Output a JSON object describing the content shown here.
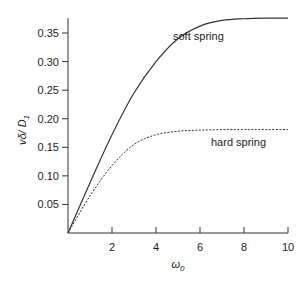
{
  "chart_data": {
    "type": "line",
    "title": "",
    "xlabel": "ω0",
    "ylabel": "vδ/D1",
    "xlim": [
      0,
      10
    ],
    "ylim": [
      0,
      0.35
    ],
    "x_ticks": [
      2,
      4,
      6,
      8,
      10
    ],
    "x_tick_labels": [
      "2",
      "4",
      "6",
      "8",
      "10"
    ],
    "y_ticks": [
      0.05,
      0.1,
      0.15,
      0.2,
      0.25,
      0.3,
      0.35
    ],
    "y_tick_labels": [
      "0.05",
      "0.10",
      "0.15",
      "0.20",
      "0.25",
      "0.30",
      "0.35"
    ],
    "grid": false,
    "legend": "none (inline annotations)",
    "x": [
      0,
      1,
      2,
      3,
      4,
      5,
      6,
      7,
      8,
      9,
      10
    ],
    "series": [
      {
        "name": "soft spring",
        "style": "solid",
        "values": [
          0,
          0.088,
          0.172,
          0.245,
          0.3,
          0.34,
          0.362,
          0.372,
          0.375,
          0.376,
          0.376
        ]
      },
      {
        "name": "hard spring",
        "style": "dotted",
        "values": [
          0,
          0.065,
          0.118,
          0.155,
          0.172,
          0.178,
          0.18,
          0.181,
          0.181,
          0.181,
          0.181
        ]
      }
    ],
    "annotations": [
      {
        "text": "soft spring",
        "x": 5.2,
        "y": 0.33
      },
      {
        "text": "hard spring",
        "x": 6.0,
        "y": 0.16
      }
    ]
  },
  "labels": {
    "xlabel_main": "ω",
    "xlabel_sub": "0",
    "ylabel_main": "vδ/ D",
    "ylabel_sub": "1",
    "soft": "soft spring",
    "hard": "hard spring"
  }
}
